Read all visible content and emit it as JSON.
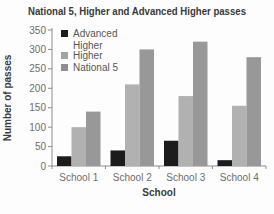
{
  "chart_data": {
    "type": "bar",
    "title": "National 5, Higher and Advanced Higher passes",
    "xlabel": "School",
    "ylabel": "Number of passes",
    "categories": [
      "School 1",
      "School 2",
      "School 3",
      "School 4"
    ],
    "series": [
      {
        "name": "Advanced Higher",
        "color": "#1c1c1c",
        "values": [
          25,
          40,
          65,
          15
        ]
      },
      {
        "name": "Higher",
        "color": "#b1b1b1",
        "values": [
          100,
          210,
          180,
          155
        ]
      },
      {
        "name": "National 5",
        "color": "#989898",
        "values": [
          140,
          300,
          320,
          280
        ]
      }
    ],
    "ylim": [
      0,
      350
    ],
    "yticks": [
      0,
      50,
      100,
      150,
      200,
      250,
      300,
      350
    ],
    "grid": false,
    "legend_position": "top-left-inside",
    "legend": [
      {
        "lines": [
          "Advanced",
          "Higher"
        ],
        "color": "#1c1c1c"
      },
      {
        "lines": [
          "Higher"
        ],
        "color": "#a3a3a3"
      },
      {
        "lines": [
          "National 5"
        ],
        "color": "#8f8f8f"
      }
    ]
  },
  "colors": {
    "axis_line": "#8c8c8c",
    "tick_text": "#6e6e6e",
    "title_text": "#3a3a3a",
    "legend_text": "#565656",
    "background": "#fdfdfd"
  }
}
